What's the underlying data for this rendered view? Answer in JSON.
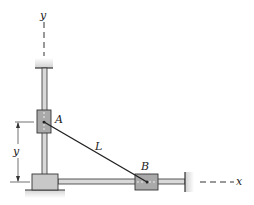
{
  "diagram": {
    "type": "mechanism",
    "labels": {
      "y_axis": "y",
      "x_axis": "x",
      "collar_a": "A",
      "collar_b": "B",
      "rod": "L",
      "dimension_y": "y"
    },
    "colors": {
      "rod_fill": "#d9d9d9",
      "collar_fill": "#a9a9a9",
      "block_fill": "#c8c8c8",
      "ground_fill": "#e6e6e6",
      "line": "#222222"
    }
  }
}
